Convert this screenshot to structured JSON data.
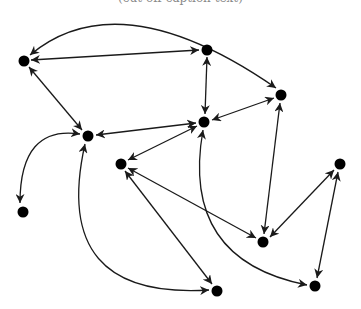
{
  "caption": "(cut-off caption text)",
  "colors": {
    "node": "#000000",
    "edge": "#1a1a1a",
    "background": "#ffffff"
  },
  "nodes": [
    {
      "id": "A",
      "x": 24,
      "y": 61
    },
    {
      "id": "B",
      "x": 207,
      "y": 50
    },
    {
      "id": "C",
      "x": 281,
      "y": 95
    },
    {
      "id": "D",
      "x": 88,
      "y": 136
    },
    {
      "id": "E",
      "x": 204,
      "y": 122
    },
    {
      "id": "F",
      "x": 23,
      "y": 212
    },
    {
      "id": "G",
      "x": 121,
      "y": 164
    },
    {
      "id": "H",
      "x": 340,
      "y": 164
    },
    {
      "id": "I",
      "x": 263,
      "y": 242
    },
    {
      "id": "J",
      "x": 217,
      "y": 291
    },
    {
      "id": "K",
      "x": 315,
      "y": 286
    }
  ],
  "edges": [
    {
      "from": "A",
      "to": "B",
      "direction": "both",
      "shape": "straight"
    },
    {
      "from": "A",
      "to": "C",
      "direction": "both",
      "shape": "curved"
    },
    {
      "from": "A",
      "to": "D",
      "direction": "both",
      "shape": "straight"
    },
    {
      "from": "B",
      "to": "E",
      "direction": "both",
      "shape": "straight"
    },
    {
      "from": "C",
      "to": "E",
      "direction": "both",
      "shape": "straight"
    },
    {
      "from": "C",
      "to": "I",
      "direction": "both",
      "shape": "straight"
    },
    {
      "from": "D",
      "to": "E",
      "direction": "both",
      "shape": "straight"
    },
    {
      "from": "D",
      "to": "F",
      "direction": "both",
      "shape": "curved"
    },
    {
      "from": "D",
      "to": "J",
      "direction": "both",
      "shape": "curved"
    },
    {
      "from": "E",
      "to": "G",
      "direction": "both",
      "shape": "straight"
    },
    {
      "from": "E",
      "to": "K",
      "direction": "both",
      "shape": "curved"
    },
    {
      "from": "G",
      "to": "I",
      "direction": "both",
      "shape": "straight"
    },
    {
      "from": "G",
      "to": "J",
      "direction": "both",
      "shape": "straight"
    },
    {
      "from": "I",
      "to": "H",
      "direction": "both",
      "shape": "straight"
    },
    {
      "from": "H",
      "to": "K",
      "direction": "both",
      "shape": "straight"
    }
  ]
}
